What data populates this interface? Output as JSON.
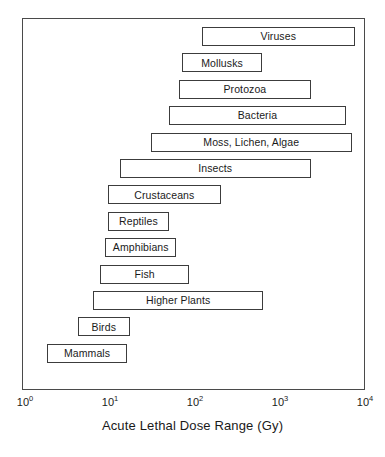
{
  "chart_data": {
    "type": "bar",
    "orientation": "horizontal",
    "title": "",
    "xlabel": "Acute Lethal Dose Range (Gy)",
    "ylabel": "",
    "xscale": "log",
    "xlim": [
      1,
      10000
    ],
    "grid": false,
    "legend": null,
    "xtick_labels": [
      "10",
      "10",
      "10",
      "10",
      "10"
    ],
    "xtick_exponents": [
      "0",
      "1",
      "2",
      "3",
      "4"
    ],
    "xtick_values": [
      1,
      10,
      100,
      1000,
      10000
    ],
    "categories": [
      "Viruses",
      "Mollusks",
      "Protozoa",
      "Bacteria",
      "Moss, Lichen, Algae",
      "Insects",
      "Crustaceans",
      "Reptiles",
      "Amphibians",
      "Fish",
      "Higher Plants",
      "Birds",
      "Mammals"
    ],
    "ranges": [
      {
        "label": "Viruses",
        "low": 120,
        "high": 7600
      },
      {
        "label": "Mollusks",
        "low": 70,
        "high": 620
      },
      {
        "label": "Protozoa",
        "low": 65,
        "high": 2300
      },
      {
        "label": "Bacteria",
        "low": 49,
        "high": 6000
      },
      {
        "label": "Moss, Lichen, Algae",
        "low": 30,
        "high": 7000
      },
      {
        "label": "Insects",
        "low": 13,
        "high": 2300
      },
      {
        "label": "Crustaceans",
        "low": 9.5,
        "high": 200
      },
      {
        "label": "Reptiles",
        "low": 9.5,
        "high": 49
      },
      {
        "label": "Amphibians",
        "low": 8.8,
        "high": 60
      },
      {
        "label": "Fish",
        "low": 7.7,
        "high": 85
      },
      {
        "label": "Higher Plants",
        "low": 6.3,
        "high": 640
      },
      {
        "label": "Birds",
        "low": 4.2,
        "high": 17
      },
      {
        "label": "Mammals",
        "low": 1.8,
        "high": 16
      }
    ]
  },
  "axis": {
    "title": "Acute Lethal Dose Range (Gy)"
  }
}
